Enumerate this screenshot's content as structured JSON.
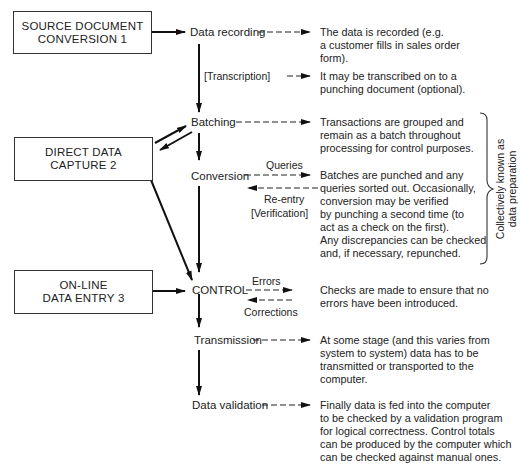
{
  "boxes": [
    {
      "id": "source",
      "line1": "SOURCE DOCUMENT",
      "line2": "CONVERSION 1"
    },
    {
      "id": "direct",
      "line1": "DIRECT DATA",
      "line2": "CAPTURE 2"
    },
    {
      "id": "online",
      "line1": "ON-LINE",
      "line2": "DATA ENTRY 3"
    }
  ],
  "steps": {
    "recording": "Data recording",
    "transcription": "[Transcription]",
    "batching": "Batching",
    "conversion": "Conversion",
    "control": "CONTROL",
    "transmission": "Transmission",
    "validation": "Data validation"
  },
  "flows": {
    "queries": "Queries",
    "reentry": "Re-entry",
    "verification": "[Verification]",
    "errors": "Errors",
    "corrections": "Corrections"
  },
  "descriptions": {
    "recording": "The data is recorded (e.g.\na customer fills in sales order\nform).",
    "transcription": "It may be transcribed on to a\npunching document (optional).",
    "batching": "Transactions are grouped and\nremain as a batch throughout\nprocessing for control purposes.",
    "conversion": "Batches are punched and any\nqueries sorted out. Occasionally,\nconversion may be verified\nby punching a second time (to\nact as a check on the first).\nAny discrepancies can be checked\nand, if necessary, repunched.",
    "control": "Checks are made to ensure that no\nerrors have been introduced.",
    "transmission": "At some stage (and this varies from\nsystem to system) data has to be\ntransmitted or transported to the\ncomputer.",
    "validation": "Finally data is fed into the computer\nto be checked by a validation program\nfor logical correctness. Control totals\ncan be produced by the computer which\ncan be checked against manual ones."
  },
  "brace_label": "Collectively known as\ndata preparation"
}
